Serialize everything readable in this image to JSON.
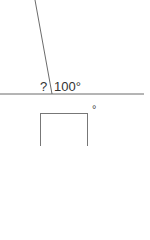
{
  "diagram": {
    "unknown_label": "?",
    "known_angle_label": "100°",
    "answer_unit": "°",
    "answer_value": "",
    "line_color": "#6b6b6b",
    "text_color": "#333333"
  }
}
